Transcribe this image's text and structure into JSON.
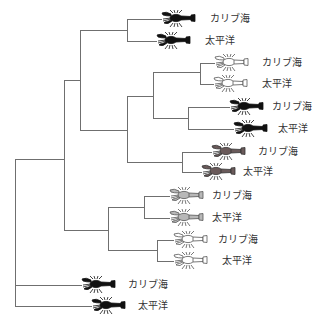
{
  "diagram": {
    "type": "phylogenetic-tree",
    "line_color": "#6f6f6f",
    "icon_style_colors": {
      "black": {
        "fill": "#111111",
        "stroke": "#111111"
      },
      "outline": {
        "fill": "#ffffff",
        "stroke": "#555555"
      },
      "darkgray": {
        "fill": "#6a5a5a",
        "stroke": "#333333"
      },
      "lightgray": {
        "fill": "#b8b8b8",
        "stroke": "#555555"
      }
    },
    "leaves": [
      {
        "id": "l1",
        "label": "カリブ海",
        "style": "black",
        "y": 19,
        "branch_from": 127,
        "icon_x": 160,
        "label_x": 210
      },
      {
        "id": "l2",
        "label": "太平洋",
        "style": "black",
        "y": 41,
        "branch_from": 127,
        "icon_x": 155,
        "label_x": 205
      },
      {
        "id": "l3",
        "label": "カリブ海",
        "style": "outline",
        "y": 63,
        "branch_from": 200,
        "icon_x": 213,
        "label_x": 262
      },
      {
        "id": "l4",
        "label": "太平洋",
        "style": "outline",
        "y": 84,
        "branch_from": 200,
        "icon_x": 212,
        "label_x": 262
      },
      {
        "id": "l5",
        "label": "カリブ海",
        "style": "black",
        "y": 107,
        "branch_from": 188,
        "icon_x": 228,
        "label_x": 272
      },
      {
        "id": "l6",
        "label": "太平洋",
        "style": "black",
        "y": 129,
        "branch_from": 188,
        "icon_x": 232,
        "label_x": 278
      },
      {
        "id": "l7",
        "label": "カリブ海",
        "style": "darkgray",
        "y": 152,
        "branch_from": 182,
        "icon_x": 210,
        "label_x": 258
      },
      {
        "id": "l8",
        "label": "太平洋",
        "style": "darkgray",
        "y": 172,
        "branch_from": 182,
        "icon_x": 200,
        "label_x": 243
      },
      {
        "id": "l9",
        "label": "カリブ海",
        "style": "lightgray",
        "y": 196,
        "branch_from": 144,
        "icon_x": 168,
        "label_x": 212
      },
      {
        "id": "l10",
        "label": "太平洋",
        "style": "lightgray",
        "y": 218,
        "branch_from": 144,
        "icon_x": 168,
        "label_x": 212
      },
      {
        "id": "l11",
        "label": "カリブ海",
        "style": "outline",
        "y": 240,
        "branch_from": 157,
        "icon_x": 172,
        "label_x": 218
      },
      {
        "id": "l12",
        "label": "太平洋",
        "style": "outline",
        "y": 261,
        "branch_from": 157,
        "icon_x": 172,
        "label_x": 222
      },
      {
        "id": "l13",
        "label": "カリブ海",
        "style": "black",
        "y": 285,
        "branch_from": 15,
        "icon_x": 80,
        "label_x": 128
      },
      {
        "id": "l14",
        "label": "太平洋",
        "style": "black",
        "y": 306,
        "branch_from": 15,
        "icon_x": 90,
        "label_x": 138
      }
    ],
    "internal_nodes": [
      {
        "id": "root",
        "x": 15,
        "y_top": 159,
        "y_bottom": 306,
        "parent_x": null,
        "y": null
      },
      {
        "id": "n1",
        "x": 64,
        "y_top": 80,
        "y_bottom": 230,
        "parent_x": 15,
        "y": 159
      },
      {
        "id": "n2",
        "x": 80,
        "y_top": 30,
        "y_bottom": 130,
        "parent_x": 64,
        "y": 80
      },
      {
        "id": "n3",
        "x": 127,
        "y_top": 19,
        "y_bottom": 41,
        "parent_x": 80,
        "y": 30
      },
      {
        "id": "n4",
        "x": 127,
        "y_top": 96,
        "y_bottom": 162,
        "parent_x": 80,
        "y": 130
      },
      {
        "id": "n5",
        "x": 153,
        "y_top": 72,
        "y_bottom": 118,
        "parent_x": 127,
        "y": 96
      },
      {
        "id": "n6",
        "x": 200,
        "y_top": 63,
        "y_bottom": 84,
        "parent_x": 153,
        "y": 72
      },
      {
        "id": "n7",
        "x": 188,
        "y_top": 107,
        "y_bottom": 129,
        "parent_x": 153,
        "y": 118
      },
      {
        "id": "n8",
        "x": 182,
        "y_top": 152,
        "y_bottom": 172,
        "parent_x": 127,
        "y": 162
      },
      {
        "id": "n9",
        "x": 108,
        "y_top": 207,
        "y_bottom": 250,
        "parent_x": 64,
        "y": 230
      },
      {
        "id": "n10",
        "x": 144,
        "y_top": 196,
        "y_bottom": 218,
        "parent_x": 108,
        "y": 207
      },
      {
        "id": "n11",
        "x": 157,
        "y_top": 240,
        "y_bottom": 261,
        "parent_x": 108,
        "y": 250
      }
    ],
    "icon_name": "crayfish-icon"
  }
}
